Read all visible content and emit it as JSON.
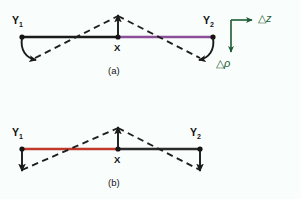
{
  "figure": {
    "background_color": "#f9fdfc",
    "width": 301,
    "height": 199
  },
  "panels": [
    {
      "id": "a",
      "caption": "(a)",
      "nodes": [
        {
          "name": "Y1",
          "label": "Y",
          "sub": "1"
        },
        {
          "name": "X",
          "label": "X",
          "sub": ""
        },
        {
          "name": "Y2",
          "label": "Y",
          "sub": "2"
        }
      ],
      "backbone_left_color": "#1a1a1a",
      "backbone_right_color": "#8a4f96",
      "displacement_mode": "symmetric-bend",
      "arrow_center_direction": "up",
      "arrow_end_direction": "curved-outward-down"
    },
    {
      "id": "b",
      "caption": "(b)",
      "nodes": [
        {
          "name": "Y1",
          "label": "Y",
          "sub": "1"
        },
        {
          "name": "X",
          "label": "X",
          "sub": ""
        },
        {
          "name": "Y2",
          "label": "Y",
          "sub": "2"
        }
      ],
      "backbone_left_color": "#c0392b",
      "backbone_right_color": "#2b2b2b",
      "displacement_mode": "antisymmetric-bend",
      "arrow_center_direction": "up",
      "arrow_end_direction": "straight-down"
    }
  ],
  "axis_legend": {
    "name": "coordinate-axes",
    "color": "#1d5b33",
    "horizontal": {
      "delta": "△",
      "symbol": "z",
      "direction": "right"
    },
    "vertical": {
      "delta": "△",
      "symbol": "ρ",
      "direction": "down"
    }
  }
}
